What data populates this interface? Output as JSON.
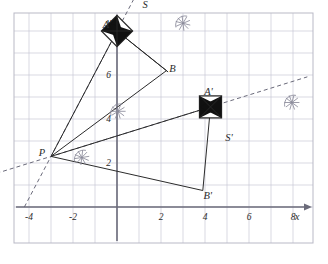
{
  "figure": {
    "type": "geometry-construction"
  },
  "axes": {
    "x_axis_label": "x",
    "y_axis_label": "y",
    "x_ticks": [
      {
        "value": -4,
        "label": "-4"
      },
      {
        "value": -2,
        "label": "-2"
      },
      {
        "value": 2,
        "label": "2"
      },
      {
        "value": 4,
        "label": "4"
      },
      {
        "value": 6,
        "label": "6"
      },
      {
        "value": 8,
        "label": "8"
      }
    ],
    "y_ticks": [
      {
        "value": 2,
        "label": "2"
      },
      {
        "value": 4,
        "label": "4"
      },
      {
        "value": 6,
        "label": "6"
      },
      {
        "value": 8,
        "label": "8"
      },
      {
        "value": 10,
        "label": "10"
      }
    ],
    "x_range": [
      -4.7,
      8.9
    ],
    "y_range": [
      -0.9,
      8.8
    ],
    "grid": true,
    "grid_color": "#c9c9d6",
    "axis_color": "#6b6b7a",
    "frame_color": "#b9b9c6"
  },
  "points": [
    {
      "name": "A",
      "label": "A",
      "x": 0.0,
      "y": 8.0
    },
    {
      "name": "B",
      "label": "B",
      "x": 2.25,
      "y": 6.2
    },
    {
      "name": "P",
      "label": "P",
      "x": -3.0,
      "y": 2.3
    },
    {
      "name": "A2",
      "label": "A'",
      "x": 4.25,
      "y": 4.55
    },
    {
      "name": "B2",
      "label": "B'",
      "x": 3.9,
      "y": 0.75
    },
    {
      "name": "S",
      "label": "S",
      "x": 1.1,
      "y": 8.45
    },
    {
      "name": "S2",
      "label": "S'",
      "x": 4.95,
      "y": 3.55
    }
  ],
  "shapes": {
    "triangle_original": {
      "name": "PAB",
      "vertices": [
        "P",
        "A",
        "B"
      ]
    },
    "triangle_image": {
      "name": "PA'B'",
      "vertices": [
        "P",
        "A2",
        "B2"
      ]
    }
  },
  "markers": [
    {
      "name": "square-S",
      "kind": "diamond-bowtie",
      "at": "A",
      "size": 11,
      "rotation": 45
    },
    {
      "name": "square-S2",
      "kind": "square-bowtie",
      "at": "A2",
      "size": 11,
      "rotation": 0
    }
  ],
  "construction": {
    "dashed_rays": [
      {
        "name": "ray-P-through-A",
        "from": "P",
        "through": "A",
        "style": "dashed"
      },
      {
        "name": "ray-P-through-A2",
        "from": "P",
        "through": "A2",
        "style": "dashed"
      }
    ],
    "arc_marks": [
      {
        "name": "arc-cross-near-origin",
        "x": 0.05,
        "y": 4.35
      },
      {
        "name": "arc-cross-near-P",
        "x": -1.6,
        "y": 2.25
      },
      {
        "name": "arc-cross-upper",
        "x": 3.0,
        "y": 8.35
      },
      {
        "name": "arc-cross-right",
        "x": 7.95,
        "y": 4.75
      }
    ]
  },
  "colors": {
    "line": "#2b2b2b",
    "dashed": "#6a6a7a",
    "grid": "#c9c9d6",
    "axis": "#6b6b7a",
    "marker_fill": "#111111",
    "background": "#ffffff"
  }
}
